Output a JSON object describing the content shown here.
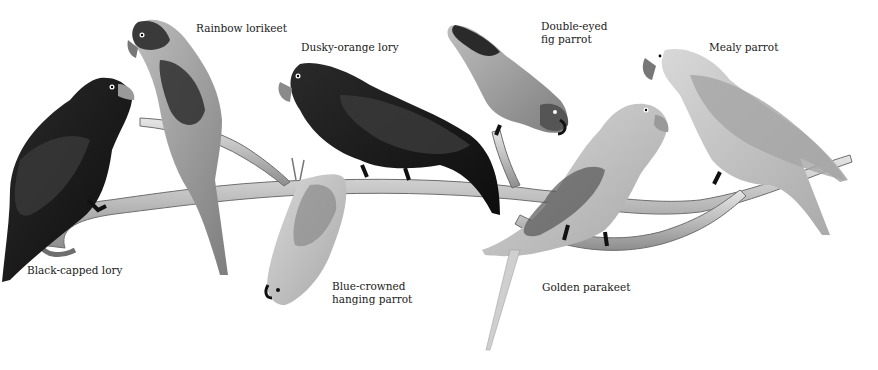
{
  "illustration": {
    "style": "grayscale pencil illustration",
    "background_color": "#ffffff",
    "branch_color": "#bdbdbd",
    "labels": [
      {
        "id": "black-capped-lory",
        "text": "Black-capped lory",
        "x": 27,
        "y": 264
      },
      {
        "id": "rainbow-lorikeet",
        "text": "Rainbow lorikeet",
        "x": 196,
        "y": 22
      },
      {
        "id": "dusky-orange-lory",
        "text": "Dusky-orange lory",
        "x": 301,
        "y": 41
      },
      {
        "id": "blue-crowned-hanging-parrot",
        "text": "Blue-crowned\nhanging parrot",
        "x": 332,
        "y": 280
      },
      {
        "id": "double-eyed-fig-parrot",
        "text": "Double-eyed\nfig parrot",
        "x": 541,
        "y": 20
      },
      {
        "id": "golden-parakeet",
        "text": "Golden parakeet",
        "x": 542,
        "y": 281
      },
      {
        "id": "mealy-parrot",
        "text": "Mealy parrot",
        "x": 709,
        "y": 41
      }
    ]
  }
}
